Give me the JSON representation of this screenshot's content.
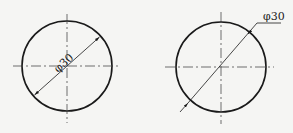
{
  "diagram": {
    "figures": [
      {
        "id": "left",
        "style": "dimension line inside circle",
        "label": "φ30",
        "center": [
          67,
          66
        ],
        "radius": 45
      },
      {
        "id": "right",
        "style": "leader line outside circle",
        "label": "φ30",
        "center": [
          221,
          67
        ],
        "radius": 45
      }
    ],
    "colors": {
      "stroke": "#1a1a1a",
      "background": "#f5f5f3"
    }
  }
}
